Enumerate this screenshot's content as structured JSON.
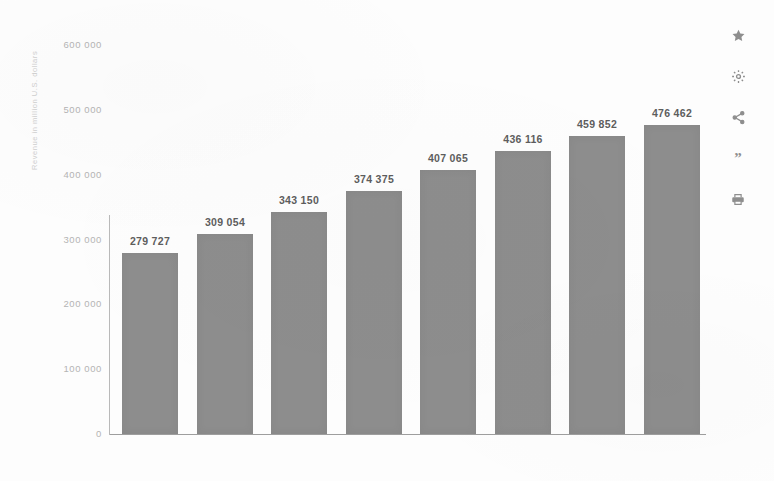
{
  "chart_data": {
    "type": "bar",
    "title": "",
    "subtitle": "",
    "xlabel": "",
    "ylabel": "Revenue in million U.S. dollars",
    "categories": [
      "2017",
      "2018",
      "2019",
      "2020",
      "2021*",
      "2022*",
      "2023*",
      "2024*"
    ],
    "values": [
      279727,
      309054,
      343150,
      374375,
      407065,
      436116,
      459852,
      476462
    ],
    "value_labels": [
      "279 727",
      "309 054",
      "343 150",
      "374 375",
      "407 065",
      "436 116",
      "459 852",
      "476 462"
    ],
    "ylim": [
      0,
      600000
    ],
    "yticks": [
      0,
      100000,
      200000,
      300000,
      400000,
      500000,
      600000
    ],
    "ytick_labels": [
      "0",
      "100 000",
      "200 000",
      "300 000",
      "400 000",
      "500 000",
      "600 000"
    ],
    "grid": false,
    "legend": null,
    "bar_color": "#8d8d8d",
    "label_color": "#5d5d5d",
    "tick_color": "#b4b4b4"
  },
  "toolbar": {
    "items": [
      {
        "icon": "star-icon",
        "label": "Favorite"
      },
      {
        "icon": "gear-icon",
        "label": "Settings"
      },
      {
        "icon": "share-icon",
        "label": "Share"
      },
      {
        "icon": "quote-icon",
        "label": "Citation",
        "glyph": "”"
      },
      {
        "icon": "print-icon",
        "label": "Print"
      }
    ]
  }
}
